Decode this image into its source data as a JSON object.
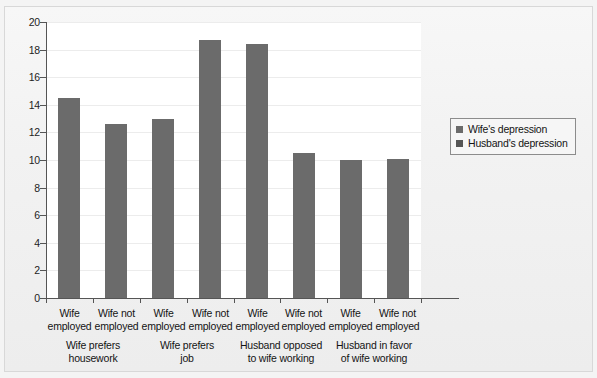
{
  "chart_data": {
    "type": "bar",
    "title": "",
    "subtitle": "",
    "xlabel": "",
    "ylabel": "",
    "ylim": [
      0,
      20
    ],
    "ytick_values": [
      0,
      2,
      4,
      6,
      8,
      10,
      12,
      14,
      16,
      18,
      20
    ],
    "ytick_labels": [
      "0",
      "2",
      "4",
      "6",
      "8",
      "10",
      "12",
      "14",
      "16",
      "18",
      "20"
    ],
    "grid": true,
    "legend_position": "right",
    "bar_color": "#6b6b6b",
    "categories": [
      "Wife employed",
      "Wife not employed",
      "Wife employed",
      "Wife not employed",
      "Wife employed",
      "Wife not employed",
      "Wife employed",
      "Wife not employed"
    ],
    "category_lines": [
      [
        "Wife",
        "employed"
      ],
      [
        "Wife not",
        "employed"
      ],
      [
        "Wife",
        "employed"
      ],
      [
        "Wife not",
        "employed"
      ],
      [
        "Wife",
        "employed"
      ],
      [
        "Wife not",
        "employed"
      ],
      [
        "Wife",
        "employed"
      ],
      [
        "Wife not",
        "employed"
      ]
    ],
    "values": [
      14.5,
      12.6,
      13.0,
      18.7,
      18.4,
      10.5,
      10.0,
      10.1
    ],
    "groups": [
      {
        "label_lines": [
          "Wife prefers",
          "housework"
        ],
        "label": "Wife prefers housework",
        "bars": [
          14.5,
          12.6
        ]
      },
      {
        "label_lines": [
          "Wife prefers",
          "job"
        ],
        "label": "Wife prefers job",
        "bars": [
          13.0,
          18.7
        ]
      },
      {
        "label_lines": [
          "Husband opposed",
          "to wife working"
        ],
        "label": "Husband opposed to wife working",
        "bars": [
          18.4,
          10.5
        ]
      },
      {
        "label_lines": [
          "Husband in favor",
          "of wife working"
        ],
        "label": "Husband in favor of wife working",
        "bars": [
          10.0,
          10.1
        ]
      }
    ],
    "legend": [
      {
        "label": "Wife's depression",
        "color": "#6b6b6b"
      },
      {
        "label": "Husband's depression",
        "color": "#555555"
      }
    ]
  }
}
